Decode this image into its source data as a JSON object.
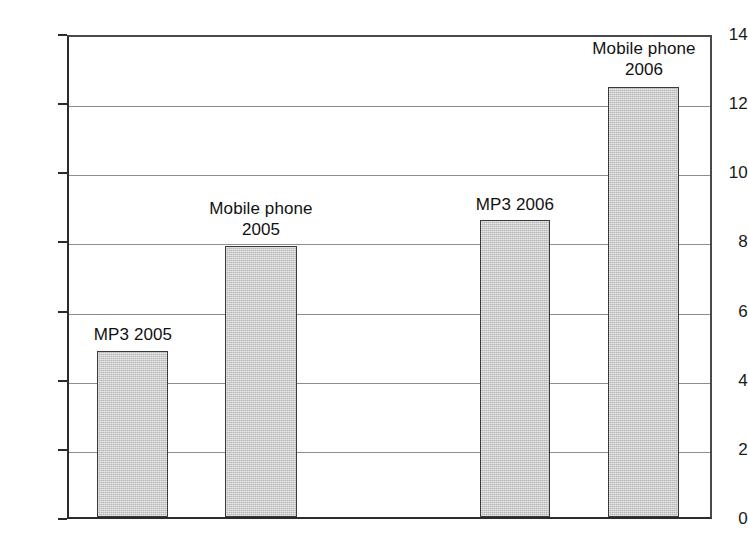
{
  "chart_data": {
    "type": "bar",
    "title": "",
    "xlabel": "",
    "ylabel": "",
    "ylim": [
      0,
      14
    ],
    "yticks": [
      0,
      2,
      4,
      6,
      8,
      10,
      12,
      14
    ],
    "ytick_labels": [
      "0",
      "2",
      "4",
      "6",
      "8",
      "10",
      "12",
      "14"
    ],
    "grid": true,
    "legend": "none",
    "categories": [
      "MP3 2005",
      "Mobile phone 2005",
      "MP3 2006",
      "Mobile phone 2006"
    ],
    "values": [
      4.8,
      7.85,
      8.6,
      12.45
    ],
    "bars": [
      {
        "label": "MP3 2005",
        "label_lines": "MP3 2005",
        "value": 4.8,
        "x_left_px": 97,
        "width_px": 71,
        "label_left_px": 86,
        "label_width_px": 94,
        "label_top_px": 324
      },
      {
        "label": "Mobile phone 2005",
        "label_lines": "Mobile phone\n2005",
        "value": 7.85,
        "x_left_px": 225,
        "width_px": 72,
        "label_left_px": 190,
        "label_width_px": 142,
        "label_top_px": 198
      },
      {
        "label": "MP3 2006",
        "label_lines": "MP3 2006",
        "value": 8.6,
        "x_left_px": 480,
        "width_px": 70,
        "label_left_px": 468,
        "label_width_px": 94,
        "label_top_px": 194
      },
      {
        "label": "Mobile phone 2006",
        "label_lines": "Mobile phone\n2006",
        "value": 12.45,
        "x_left_px": 608,
        "width_px": 71,
        "label_left_px": 574,
        "label_width_px": 140,
        "label_top_px": 38
      }
    ],
    "colors": {
      "bar_fill": "#c9c9c9",
      "bar_border": "#3a3a3a",
      "gridline": "#8d8d8d",
      "axis": "#2b2b2b",
      "text": "#1a1a1a",
      "background": "#ffffff"
    }
  }
}
